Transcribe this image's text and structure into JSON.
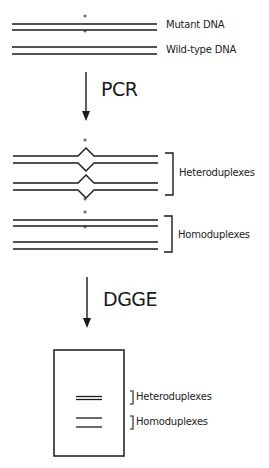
{
  "diagram": {
    "type": "dna-mutation-detection-workflow",
    "top_strands": {
      "mutant_label": "Mutant DNA",
      "wildtype_label": "Wild-type DNA",
      "mutation_marker": "*"
    },
    "steps": [
      {
        "label": "PCR"
      },
      {
        "label": "DGGE"
      }
    ],
    "pcr_products": {
      "heteroduplex_label": "Heteroduplexes",
      "homoduplex_label": "Homoduplexes"
    },
    "gel": {
      "heteroduplex_band_label": "Heteroduplexes",
      "homoduplex_band_label": "Homoduplexes"
    },
    "colors": {
      "line": "#1a1a1a",
      "background": "#ffffff"
    }
  }
}
